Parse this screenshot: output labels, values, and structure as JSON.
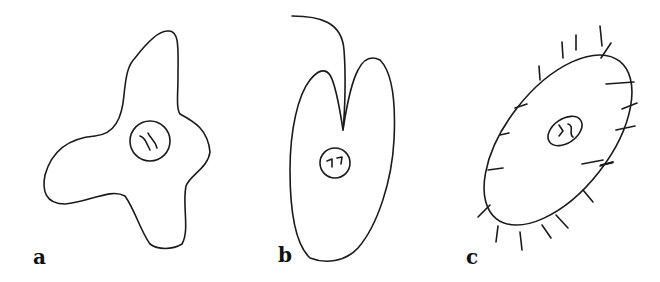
{
  "figure": {
    "panels": [
      {
        "id": "a",
        "label": "a",
        "cell_type": "amoeboid cell",
        "features": [
          "irregular lobed outline",
          "central nucleus"
        ]
      },
      {
        "id": "b",
        "label": "b",
        "cell_type": "flagellate cell",
        "features": [
          "single long flagellum",
          "cleft apex",
          "central nucleus"
        ]
      },
      {
        "id": "c",
        "label": "c",
        "cell_type": "ciliate cell",
        "features": [
          "elongated oval body",
          "short surface cilia",
          "central nucleus"
        ]
      }
    ],
    "colors": {
      "stroke": "#1a1a1a",
      "background": "#ffffff"
    }
  }
}
